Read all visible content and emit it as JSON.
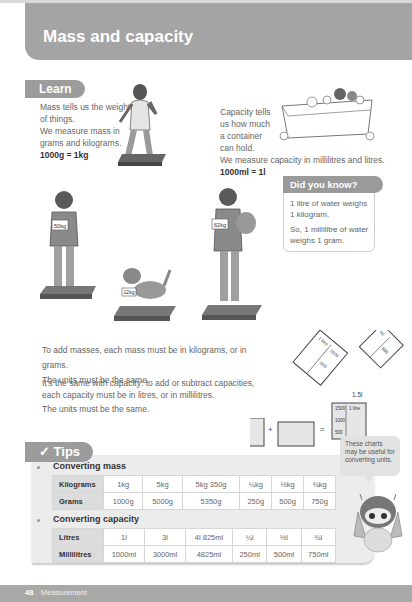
{
  "header": {
    "title": "Mass and capacity"
  },
  "learn": {
    "tag": "Learn",
    "mass_text": [
      "Mass tells us the weight",
      "of things.",
      "We measure mass in",
      "grams and kilograms."
    ],
    "mass_equation": "1000g = 1kg",
    "capacity_text": [
      "Capacity tells",
      "us how much",
      "a container",
      "can hold."
    ],
    "capacity_line": "We measure capacity in millilitres and litres.",
    "capacity_equation": "1000ml = 1l"
  },
  "illustrations": {
    "boy_label": "50kg",
    "dog_label": "12kg",
    "boy_dog_label": "62kg"
  },
  "did_you_know": {
    "title": "Did you know?",
    "line1": "1 litre of water weighs 1 kilogram.",
    "line2": "So, 1 millilitre of water weighs 1 gram."
  },
  "body_text": {
    "p1": "To add masses, each mass must be in kilograms, or in grams.",
    "p2": "The units must be the same.",
    "p3a": "It's the same with capacity: to add or subtract capacities,",
    "p3b": "each capacity must be in litres, or in millilitres.",
    "p4": "The units must be the same."
  },
  "jugs": {
    "jug1": {
      "label": "1 litre",
      "marks": [
        "1000",
        "500"
      ]
    },
    "jug2": {
      "label": "ml",
      "marks": [
        "500"
      ]
    },
    "jug3": {
      "top_label": "1.5l",
      "label": "1 litre",
      "marks": [
        "1500",
        "1000",
        "500"
      ]
    },
    "plus": "+",
    "equals": "="
  },
  "tips": {
    "tag": "✓ Tips",
    "speech": "These charts may be useful for converting units.",
    "mass": {
      "title": "Converting mass",
      "rows": [
        {
          "header": "Kilograms",
          "cells": [
            "1kg",
            "5kg",
            "5kg 350g",
            "¼kg",
            "½kg",
            "¾kg"
          ]
        },
        {
          "header": "Grams",
          "cells": [
            "1000g",
            "5000g",
            "5350g",
            "250g",
            "500g",
            "750g"
          ]
        }
      ]
    },
    "capacity": {
      "title": "Converting capacity",
      "rows": [
        {
          "header": "Litres",
          "cells": [
            "1l",
            "3l",
            "4l 825ml",
            "¼l",
            "½l",
            "¾l"
          ]
        },
        {
          "header": "Millilitres",
          "cells": [
            "1000ml",
            "3000ml",
            "4825ml",
            "250ml",
            "500ml",
            "750ml"
          ]
        }
      ]
    }
  },
  "footer": {
    "page_number": "48",
    "section": "Measurement"
  }
}
